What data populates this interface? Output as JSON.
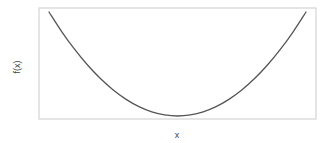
{
  "chart_data": {
    "type": "line",
    "title": "",
    "xlabel": "x",
    "ylabel": "f(x)",
    "grid": false,
    "ticks": false,
    "legend": null,
    "xlim": [
      -1,
      1
    ],
    "ylim": [
      0,
      1
    ],
    "series": [
      {
        "name": "f(x)",
        "x": [
          -1.0,
          -0.9,
          -0.8,
          -0.7,
          -0.6,
          -0.5,
          -0.4,
          -0.3,
          -0.2,
          -0.1,
          0.0,
          0.1,
          0.2,
          0.3,
          0.4,
          0.5,
          0.6,
          0.7,
          0.8,
          0.9,
          1.0
        ],
        "y": [
          1.0,
          0.81,
          0.64,
          0.49,
          0.36,
          0.25,
          0.16,
          0.09,
          0.04,
          0.01,
          0.0,
          0.01,
          0.04,
          0.09,
          0.16,
          0.25,
          0.36,
          0.49,
          0.64,
          0.81,
          1.0
        ]
      }
    ]
  },
  "colors": {
    "curve": "#555555",
    "frame": "#d4d4d4",
    "label": "#444444",
    "background": "#ffffff"
  },
  "layout": {
    "frame": {
      "left": 39,
      "top": 8,
      "right": 316,
      "bottom": 119
    },
    "plot": {
      "x0": 49,
      "x1": 306,
      "y_top": 12,
      "y_bottom": 116
    }
  }
}
